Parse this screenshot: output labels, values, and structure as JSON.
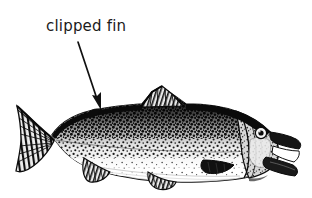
{
  "canvas": {
    "width": 312,
    "height": 198,
    "background_color": "#ffffff",
    "ink_color": "#111111"
  },
  "annotation": {
    "label_text": "clipped fin",
    "label_color": "#1b1b1b",
    "arrow": {
      "name": "arrow-pointing-to-dorsal-area",
      "start_x": 78,
      "start_y": 42,
      "end_x": 101,
      "end_y": 110,
      "head_width": 11,
      "head_length": 16,
      "color": "#111111"
    }
  },
  "illustration": {
    "subject": "trout",
    "style": "black-and-white stipple engraving",
    "orientation": "facing right",
    "parts": [
      {
        "name": "caudal-fin",
        "label": "tail fin (forked)"
      },
      {
        "name": "caudal-peduncle",
        "label": "tail base"
      },
      {
        "name": "body",
        "label": "speckled body"
      },
      {
        "name": "dorsal-fin",
        "label": "dorsal fin"
      },
      {
        "name": "adipose-fin",
        "label": "adipose fin"
      },
      {
        "name": "anal-fin",
        "label": "anal fin"
      },
      {
        "name": "pelvic-fin",
        "label": "pelvic fin"
      },
      {
        "name": "pectoral-fin",
        "label": "pectoral fin"
      },
      {
        "name": "head",
        "label": "head"
      },
      {
        "name": "gill-cover",
        "label": "operculum"
      },
      {
        "name": "eye",
        "label": "eye"
      },
      {
        "name": "mouth",
        "label": "open mouth"
      }
    ]
  }
}
